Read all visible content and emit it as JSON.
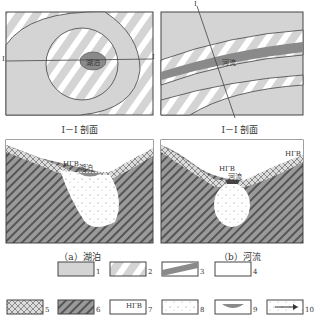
{
  "panels": {
    "lake_plan": {
      "label": "湖泊",
      "section_mark": "I"
    },
    "river_plan": {
      "label": "河流",
      "section_mark": "I"
    },
    "lake_section_caption": "I－I 剖面",
    "river_section_caption": "I－I 剖面",
    "lake_section": {
      "gw_label": "НГВ",
      "label": "湖泊"
    },
    "river_section": {
      "gw_label_left": "НГВ",
      "gw_label_right": "НГВ",
      "label": "河流"
    }
  },
  "captions": {
    "a": "（a）湖泊",
    "b": "（b）河流"
  },
  "legend": [
    {
      "num": "1",
      "pattern": "gray-fill"
    },
    {
      "num": "2",
      "pattern": "diagonal-hatch-light"
    },
    {
      "num": "3",
      "pattern": "gray-band"
    },
    {
      "num": "4",
      "pattern": "blank"
    },
    {
      "num": "5",
      "pattern": "crosshatch"
    },
    {
      "num": "6",
      "pattern": "dense-hatch"
    },
    {
      "num": "7",
      "pattern": "groundwater-level",
      "text": "НГВ"
    },
    {
      "num": "8",
      "pattern": "dotted"
    },
    {
      "num": "9",
      "pattern": "water-body"
    },
    {
      "num": "10",
      "pattern": "flow-arrow"
    }
  ],
  "colors": {
    "gray": "#d4d4d4",
    "dark_gray": "#8a8a8a",
    "line": "#444444"
  }
}
